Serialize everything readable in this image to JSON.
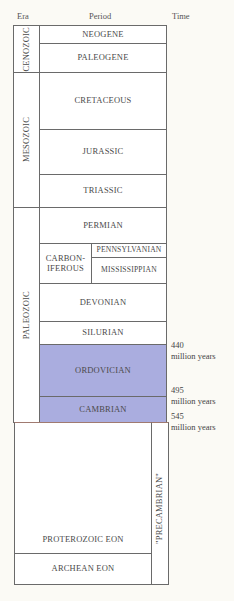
{
  "headers": {
    "era": "Era",
    "period": "Period",
    "time": "Time"
  },
  "eras": [
    {
      "name": "CENOZOIC"
    },
    {
      "name": "MESOZOIC"
    },
    {
      "name": "PALEOZOIC"
    }
  ],
  "periods": [
    {
      "name": "NEOGENE",
      "highlighted": false
    },
    {
      "name": "PALEOGENE",
      "highlighted": false
    },
    {
      "name": "CRETACEOUS",
      "highlighted": false
    },
    {
      "name": "JURASSIC",
      "highlighted": false
    },
    {
      "name": "TRIASSIC",
      "highlighted": false
    },
    {
      "name": "PERMIAN",
      "highlighted": false
    },
    {
      "name": "CARBON-\nIFEROUS",
      "highlighted": false,
      "subperiods": [
        "PENNSYLVANIAN",
        "MISSISSIPPIAN"
      ]
    },
    {
      "name": "DEVONIAN",
      "highlighted": false
    },
    {
      "name": "SILURIAN",
      "highlighted": false
    },
    {
      "name": "ORDOVICIAN",
      "highlighted": true
    },
    {
      "name": "CAMBRIAN",
      "highlighted": true
    }
  ],
  "precambrian": {
    "label": "\"PRECAMBRIAN\"",
    "eons": [
      "PROTEROZOIC EON",
      "ARCHEAN EON"
    ]
  },
  "times": [
    {
      "value": "440",
      "unit": "million years"
    },
    {
      "value": "495",
      "unit": "million years"
    },
    {
      "value": "545",
      "unit": "million years"
    }
  ],
  "colors": {
    "highlight": "#aaaddf",
    "background": "#fbfaf5",
    "border": "#6a6a6a"
  }
}
